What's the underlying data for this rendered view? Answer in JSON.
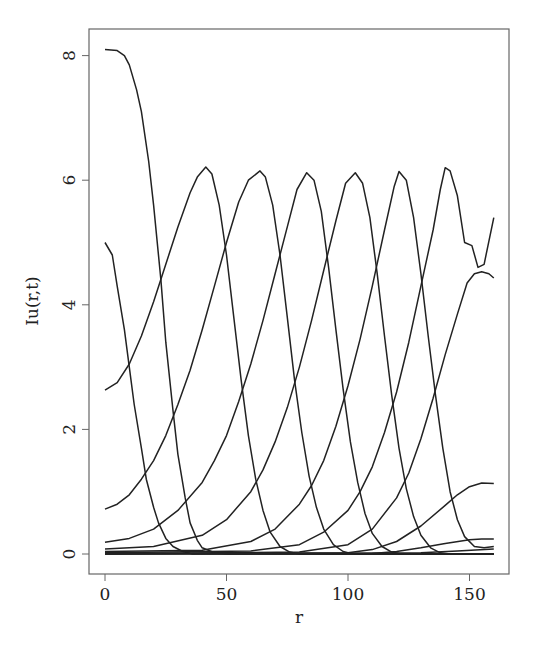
{
  "chart_data": {
    "type": "line",
    "title": "",
    "xlabel": "r",
    "ylabel": "Iu(r,t)",
    "xlim": [
      -6,
      167
    ],
    "ylim": [
      -0.3,
      8.4
    ],
    "xticks": [
      0,
      50,
      100,
      150
    ],
    "yticks": [
      0,
      2,
      4,
      6,
      8
    ],
    "grid": false,
    "legend": null,
    "series": [
      {
        "name": "t1",
        "points": [
          [
            0,
            8.1
          ],
          [
            5,
            8.08
          ],
          [
            8,
            8.0
          ],
          [
            10,
            7.85
          ],
          [
            13,
            7.45
          ],
          [
            15,
            7.1
          ],
          [
            18,
            6.3
          ],
          [
            20,
            5.6
          ],
          [
            23,
            4.4
          ],
          [
            25,
            3.4
          ],
          [
            28,
            2.3
          ],
          [
            30,
            1.6
          ],
          [
            33,
            0.9
          ],
          [
            35,
            0.5
          ],
          [
            38,
            0.22
          ],
          [
            40,
            0.1
          ],
          [
            45,
            0.02
          ],
          [
            50,
            0
          ],
          [
            160,
            0
          ]
        ]
      },
      {
        "name": "t2",
        "points": [
          [
            0,
            5.0
          ],
          [
            3,
            4.8
          ],
          [
            5,
            4.3
          ],
          [
            8,
            3.6
          ],
          [
            10,
            3.0
          ],
          [
            12,
            2.4
          ],
          [
            15,
            1.7
          ],
          [
            17,
            1.2
          ],
          [
            20,
            0.75
          ],
          [
            22,
            0.5
          ],
          [
            25,
            0.25
          ],
          [
            28,
            0.12
          ],
          [
            32,
            0.04
          ],
          [
            36,
            0
          ],
          [
            160,
            0
          ]
        ]
      },
      {
        "name": "t3",
        "points": [
          [
            0,
            2.63
          ],
          [
            5,
            2.75
          ],
          [
            10,
            3.05
          ],
          [
            15,
            3.5
          ],
          [
            20,
            4.05
          ],
          [
            25,
            4.65
          ],
          [
            30,
            5.25
          ],
          [
            35,
            5.8
          ],
          [
            38,
            6.05
          ],
          [
            41.5,
            6.21
          ],
          [
            44,
            6.1
          ],
          [
            47,
            5.6
          ],
          [
            50,
            4.8
          ],
          [
            53,
            3.8
          ],
          [
            56,
            2.8
          ],
          [
            59,
            1.9
          ],
          [
            62,
            1.2
          ],
          [
            65,
            0.7
          ],
          [
            68,
            0.35
          ],
          [
            72,
            0.12
          ],
          [
            76,
            0.03
          ],
          [
            80,
            0
          ],
          [
            160,
            0
          ]
        ]
      },
      {
        "name": "t4",
        "points": [
          [
            0,
            0.72
          ],
          [
            5,
            0.8
          ],
          [
            10,
            0.95
          ],
          [
            15,
            1.2
          ],
          [
            20,
            1.5
          ],
          [
            25,
            1.9
          ],
          [
            30,
            2.4
          ],
          [
            35,
            2.95
          ],
          [
            40,
            3.6
          ],
          [
            45,
            4.3
          ],
          [
            50,
            5.0
          ],
          [
            55,
            5.65
          ],
          [
            59,
            6.0
          ],
          [
            63.8,
            6.15
          ],
          [
            66,
            6.05
          ],
          [
            69,
            5.6
          ],
          [
            72,
            4.8
          ],
          [
            75,
            3.8
          ],
          [
            78,
            2.8
          ],
          [
            81,
            1.95
          ],
          [
            84,
            1.25
          ],
          [
            87,
            0.75
          ],
          [
            90,
            0.4
          ],
          [
            94,
            0.15
          ],
          [
            98,
            0.04
          ],
          [
            102,
            0
          ],
          [
            160,
            0
          ]
        ]
      },
      {
        "name": "t5",
        "points": [
          [
            0,
            0.19
          ],
          [
            10,
            0.25
          ],
          [
            20,
            0.4
          ],
          [
            30,
            0.7
          ],
          [
            40,
            1.15
          ],
          [
            45,
            1.5
          ],
          [
            50,
            1.9
          ],
          [
            55,
            2.45
          ],
          [
            60,
            3.05
          ],
          [
            65,
            3.75
          ],
          [
            70,
            4.5
          ],
          [
            75,
            5.25
          ],
          [
            79,
            5.85
          ],
          [
            83,
            6.12
          ],
          [
            86,
            6.0
          ],
          [
            89,
            5.5
          ],
          [
            92,
            4.6
          ],
          [
            95,
            3.6
          ],
          [
            98,
            2.65
          ],
          [
            101,
            1.8
          ],
          [
            104,
            1.15
          ],
          [
            107,
            0.65
          ],
          [
            110,
            0.33
          ],
          [
            114,
            0.12
          ],
          [
            118,
            0.03
          ],
          [
            122,
            0
          ],
          [
            160,
            0
          ]
        ]
      },
      {
        "name": "t6",
        "points": [
          [
            0,
            0.08
          ],
          [
            20,
            0.12
          ],
          [
            40,
            0.3
          ],
          [
            50,
            0.55
          ],
          [
            60,
            1.0
          ],
          [
            65,
            1.35
          ],
          [
            70,
            1.8
          ],
          [
            75,
            2.35
          ],
          [
            80,
            3.0
          ],
          [
            85,
            3.75
          ],
          [
            90,
            4.55
          ],
          [
            95,
            5.35
          ],
          [
            99,
            5.95
          ],
          [
            103,
            6.12
          ],
          [
            106,
            5.95
          ],
          [
            109,
            5.4
          ],
          [
            112,
            4.5
          ],
          [
            115,
            3.5
          ],
          [
            118,
            2.55
          ],
          [
            121,
            1.7
          ],
          [
            124,
            1.05
          ],
          [
            127,
            0.6
          ],
          [
            130,
            0.3
          ],
          [
            134,
            0.1
          ],
          [
            138,
            0.02
          ],
          [
            142,
            0
          ],
          [
            160,
            0
          ]
        ]
      },
      {
        "name": "t7",
        "points": [
          [
            0,
            0.04
          ],
          [
            40,
            0.06
          ],
          [
            60,
            0.2
          ],
          [
            70,
            0.4
          ],
          [
            80,
            0.8
          ],
          [
            85,
            1.1
          ],
          [
            90,
            1.5
          ],
          [
            95,
            2.05
          ],
          [
            100,
            2.7
          ],
          [
            105,
            3.45
          ],
          [
            110,
            4.3
          ],
          [
            115,
            5.2
          ],
          [
            119,
            5.9
          ],
          [
            121,
            6.14
          ],
          [
            124,
            6.0
          ],
          [
            127,
            5.4
          ],
          [
            130,
            4.5
          ],
          [
            133,
            3.5
          ],
          [
            136,
            2.55
          ],
          [
            139,
            1.7
          ],
          [
            142,
            1.0
          ],
          [
            145,
            0.55
          ],
          [
            148,
            0.28
          ],
          [
            152,
            0.12
          ],
          [
            156,
            0.1
          ],
          [
            160,
            0.12
          ]
        ]
      },
      {
        "name": "t8",
        "points": [
          [
            0,
            0.02
          ],
          [
            60,
            0.05
          ],
          [
            80,
            0.15
          ],
          [
            90,
            0.35
          ],
          [
            100,
            0.7
          ],
          [
            105,
            1.0
          ],
          [
            110,
            1.4
          ],
          [
            115,
            1.95
          ],
          [
            120,
            2.6
          ],
          [
            125,
            3.4
          ],
          [
            130,
            4.3
          ],
          [
            135,
            5.2
          ],
          [
            138,
            5.85
          ],
          [
            140,
            6.2
          ],
          [
            142,
            6.15
          ],
          [
            145,
            5.75
          ],
          [
            148,
            5.0
          ],
          [
            151,
            4.95
          ],
          [
            153.5,
            4.6
          ],
          [
            156,
            4.65
          ],
          [
            160,
            5.4
          ]
        ]
      },
      {
        "name": "t9",
        "points": [
          [
            0,
            0.01
          ],
          [
            80,
            0.03
          ],
          [
            100,
            0.15
          ],
          [
            110,
            0.4
          ],
          [
            120,
            0.9
          ],
          [
            125,
            1.3
          ],
          [
            130,
            1.85
          ],
          [
            135,
            2.5
          ],
          [
            140,
            3.2
          ],
          [
            145,
            3.85
          ],
          [
            149,
            4.35
          ],
          [
            152,
            4.5
          ],
          [
            155,
            4.53
          ],
          [
            158,
            4.5
          ],
          [
            160,
            4.43
          ]
        ]
      },
      {
        "name": "t10",
        "points": [
          [
            0,
            0
          ],
          [
            100,
            0.02
          ],
          [
            110,
            0.07
          ],
          [
            120,
            0.2
          ],
          [
            130,
            0.45
          ],
          [
            140,
            0.78
          ],
          [
            145,
            0.95
          ],
          [
            150,
            1.08
          ],
          [
            155,
            1.14
          ],
          [
            160,
            1.13
          ]
        ]
      },
      {
        "name": "t11",
        "points": [
          [
            0,
            0
          ],
          [
            110,
            0.01
          ],
          [
            120,
            0.04
          ],
          [
            130,
            0.1
          ],
          [
            140,
            0.17
          ],
          [
            150,
            0.23
          ],
          [
            155,
            0.24
          ],
          [
            160,
            0.24
          ]
        ]
      },
      {
        "name": "t12",
        "points": [
          [
            0,
            0
          ],
          [
            130,
            0.02
          ],
          [
            145,
            0.05
          ],
          [
            160,
            0.08
          ]
        ]
      }
    ]
  }
}
